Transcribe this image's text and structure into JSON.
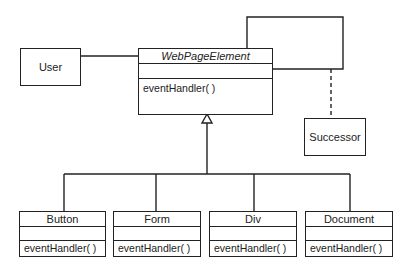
{
  "diagram": {
    "type": "UML class diagram (Chain of Responsibility)",
    "abstract_class": {
      "name": "WebPageElement",
      "operations": [
        "eventHandler( )"
      ]
    },
    "associated": {
      "user": {
        "name": "User"
      },
      "successor": {
        "name": "Successor"
      }
    },
    "subclasses": [
      {
        "name": "Button",
        "operation": "eventHandler( )"
      },
      {
        "name": "Form",
        "operation": "eventHandler( )"
      },
      {
        "name": "Div",
        "operation": "eventHandler( )"
      },
      {
        "name": "Document",
        "operation": "eventHandler( )"
      }
    ],
    "colors": {
      "line": "#222222",
      "background": "#ffffff"
    }
  }
}
